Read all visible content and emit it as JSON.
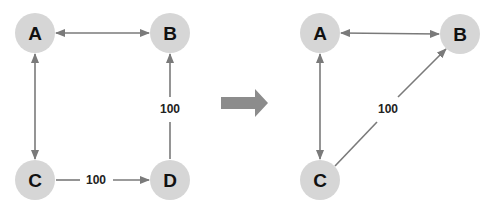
{
  "colors": {
    "node_fill": "#d6d6d6",
    "edge": "#7a7a7a",
    "transition_arrow": "#8c8c8c",
    "text": "#111111"
  },
  "before": {
    "nodes": [
      {
        "id": "A",
        "label": "A",
        "x": 35,
        "y": 33
      },
      {
        "id": "B",
        "label": "B",
        "x": 170,
        "y": 33
      },
      {
        "id": "C",
        "label": "C",
        "x": 35,
        "y": 180
      },
      {
        "id": "D",
        "label": "D",
        "x": 170,
        "y": 180
      }
    ],
    "edges": [
      {
        "from": "A",
        "to": "B",
        "direction": "bidirectional",
        "label": ""
      },
      {
        "from": "A",
        "to": "C",
        "direction": "bidirectional",
        "label": ""
      },
      {
        "from": "C",
        "to": "D",
        "direction": "forward",
        "label": "100"
      },
      {
        "from": "D",
        "to": "B",
        "direction": "forward",
        "label": "100"
      }
    ],
    "labels": {
      "cd": "100",
      "db": "100"
    }
  },
  "transition": {
    "icon": "right-arrow-icon"
  },
  "after": {
    "nodes": [
      {
        "id": "A",
        "label": "A",
        "x": 320,
        "y": 33
      },
      {
        "id": "B",
        "label": "B",
        "x": 460,
        "y": 34
      },
      {
        "id": "C",
        "label": "C",
        "x": 320,
        "y": 180
      }
    ],
    "edges": [
      {
        "from": "A",
        "to": "B",
        "direction": "bidirectional",
        "label": ""
      },
      {
        "from": "A",
        "to": "C",
        "direction": "bidirectional",
        "label": ""
      },
      {
        "from": "C",
        "to": "B",
        "direction": "forward",
        "label": "100"
      }
    ],
    "labels": {
      "cb": "100"
    }
  }
}
